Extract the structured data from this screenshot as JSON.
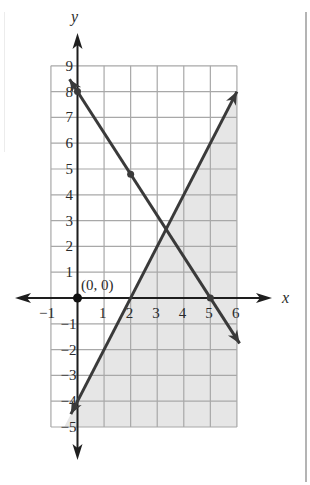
{
  "chart_data": {
    "type": "line",
    "title": "",
    "xlabel": "x",
    "ylabel": "y",
    "xlim": [
      -1,
      6
    ],
    "ylim": [
      -5,
      9
    ],
    "grid": true,
    "x_ticks": [
      "−1",
      "1",
      "2",
      "3",
      "4",
      "5",
      "6"
    ],
    "y_ticks": [
      "9",
      "8",
      "7",
      "6",
      "5",
      "4",
      "3",
      "2",
      "1",
      "−1",
      "−2",
      "−3",
      "−4",
      "−5"
    ],
    "series": [
      {
        "name": "line-decreasing",
        "equation": "y = 8 - 1.6x",
        "points": [
          [
            -0.3,
            8.48
          ],
          [
            0,
            8
          ],
          [
            2,
            4.8
          ],
          [
            5,
            0
          ],
          [
            6.1,
            -1.76
          ]
        ],
        "marked_points": [
          [
            0,
            8
          ],
          [
            2,
            4.8
          ],
          [
            5,
            0
          ]
        ]
      },
      {
        "name": "line-increasing",
        "equation": "y = 2x - 4",
        "points": [
          [
            -0.25,
            -4.5
          ],
          [
            0,
            -4
          ],
          [
            2,
            0
          ],
          [
            6,
            8
          ]
        ],
        "marked_points": [
          [
            0,
            -4
          ],
          [
            2,
            0
          ]
        ]
      }
    ],
    "shaded_region": {
      "description": "below y = 2x - 4 within the grid",
      "vertices": [
        [
          -0.5,
          -5
        ],
        [
          6,
          8
        ],
        [
          6,
          -5
        ]
      ],
      "color": "#e6e6e6"
    },
    "annotations": [
      {
        "text": "(0, 0)",
        "x": 0,
        "y": 0
      }
    ],
    "origin_point": [
      0,
      0
    ]
  },
  "labels": {
    "x_axis": "x",
    "y_axis": "y",
    "origin": "(0, 0)"
  },
  "colors": {
    "line": "#3a3a3a",
    "axis": "#1e1e1e",
    "grid": "#a8a8a8",
    "shade": "#e6e6e6"
  }
}
